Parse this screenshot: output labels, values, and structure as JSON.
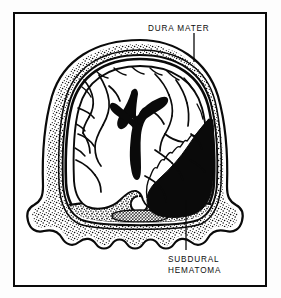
{
  "figure": {
    "kind": "anatomical-illustration",
    "style": "black-and-white line drawing",
    "frame": {
      "border_color": "#0a0a0a",
      "background_color": "#ffffff"
    }
  },
  "labels": {
    "dura_mater": {
      "text": "DURA MATER",
      "leader": "vertical-line-down-to-dura-layer"
    },
    "subdural_hematoma_line1": {
      "text": "SUBDURAL"
    },
    "subdural_hematoma_line2": {
      "text": "HEMATOMA"
    }
  },
  "structures": [
    {
      "name": "outer-table-of-skull",
      "fill": "#ffffff",
      "stroke": "#0a0a0a"
    },
    {
      "name": "diploe-stippled-layer",
      "fill": "#ffffff",
      "texture": "stipple"
    },
    {
      "name": "inner-table-of-skull",
      "fill": "#ffffff",
      "stroke": "#0a0a0a"
    },
    {
      "name": "dura-mater-layer",
      "fill": "#0a0a0a",
      "stroke": "#0a0a0a"
    },
    {
      "name": "brain-cerebral-hemispheres",
      "fill": "#ffffff",
      "stroke": "#0a0a0a"
    },
    {
      "name": "sulci-and-vessels",
      "fill": "#0a0a0a"
    },
    {
      "name": "lateral-ventricles",
      "fill": "#0a0a0a"
    },
    {
      "name": "subdural-hematoma-mass",
      "fill": "#0a0a0a"
    },
    {
      "name": "sella-turcica-region",
      "fill": "#ffffff",
      "texture": "cross-hatch"
    },
    {
      "name": "skull-base-temporal-flare",
      "fill": "#ffffff",
      "texture": "stipple"
    }
  ],
  "colors": {
    "ink": "#0a0a0a",
    "paper": "#ffffff",
    "page": "#fdfdfd"
  }
}
